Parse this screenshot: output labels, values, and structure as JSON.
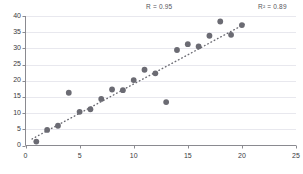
{
  "chart_data": {
    "type": "scatter",
    "title": "",
    "xlabel": "",
    "ylabel": "",
    "xlim": [
      0,
      25
    ],
    "ylim": [
      0,
      40
    ],
    "xticks": [
      0,
      5,
      10,
      15,
      20,
      25
    ],
    "yticks": [
      0,
      5,
      10,
      15,
      20,
      25,
      30,
      35,
      40
    ],
    "grid": "horizontal",
    "legend": "none",
    "marker_color": "#6b6b73",
    "trendline": {
      "style": "dotted",
      "color": "#6b6b73",
      "x_start": 0.6,
      "y_start": 2.0,
      "x_end": 20.3,
      "y_end": 37.6
    },
    "annotations": [
      {
        "name": "correlation",
        "text": "R = 0.95",
        "value": 0.95
      },
      {
        "name": "r-squared",
        "text": "R² = 0.89",
        "value": 0.89
      }
    ],
    "x": [
      1,
      2,
      3,
      4,
      5,
      6,
      7,
      8,
      9,
      10,
      11,
      12,
      13,
      14,
      15,
      16,
      17,
      18,
      19,
      20
    ],
    "y": [
      1.2,
      4.8,
      6.1,
      16.3,
      10.4,
      11.2,
      14.4,
      17.3,
      17.1,
      20.2,
      23.4,
      22.3,
      13.4,
      29.5,
      31.3,
      30.6,
      33.9,
      38.3,
      34.2,
      37.2
    ],
    "points": [
      {
        "x": 1,
        "y": 1.2
      },
      {
        "x": 2,
        "y": 4.8
      },
      {
        "x": 3,
        "y": 6.1
      },
      {
        "x": 4,
        "y": 16.3
      },
      {
        "x": 5,
        "y": 10.4
      },
      {
        "x": 6,
        "y": 11.2
      },
      {
        "x": 7,
        "y": 14.4
      },
      {
        "x": 8,
        "y": 17.3
      },
      {
        "x": 9,
        "y": 17.1
      },
      {
        "x": 10,
        "y": 20.2
      },
      {
        "x": 11,
        "y": 23.4
      },
      {
        "x": 12,
        "y": 22.3
      },
      {
        "x": 13,
        "y": 13.4
      },
      {
        "x": 14,
        "y": 29.5
      },
      {
        "x": 15,
        "y": 31.3
      },
      {
        "x": 16,
        "y": 30.6
      },
      {
        "x": 17,
        "y": 33.9
      },
      {
        "x": 18,
        "y": 38.3
      },
      {
        "x": 19,
        "y": 34.2
      },
      {
        "x": 20,
        "y": 37.2
      }
    ]
  },
  "axes": {
    "x_tick_labels": [
      "0",
      "5",
      "10",
      "15",
      "20",
      "25"
    ],
    "y_tick_labels": [
      "0",
      "5",
      "10",
      "15",
      "20",
      "25",
      "30",
      "35",
      "40"
    ],
    "axis_color": "#8a8a90",
    "gridline_color": "#e8e8ee"
  },
  "annotations": {
    "r_label": "R = 0.95",
    "r2_label": "R² = 0.89"
  }
}
